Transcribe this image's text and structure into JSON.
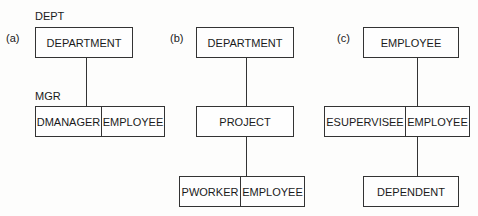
{
  "panels": [
    {
      "id": "a",
      "label": "(a)",
      "top_caption": "DEPT",
      "mid_caption": "MGR",
      "root": "DEPARTMENT",
      "child": {
        "left": "DMANAGER",
        "right": "EMPLOYEE"
      }
    },
    {
      "id": "b",
      "label": "(b)",
      "root": "DEPARTMENT",
      "middle": "PROJECT",
      "child": {
        "left": "PWORKER",
        "right": "EMPLOYEE"
      }
    },
    {
      "id": "c",
      "label": "(c)",
      "root": "EMPLOYEE",
      "middle": {
        "left": "ESUPERVISEE",
        "right": "EMPLOYEE"
      },
      "child": "DEPENDENT"
    }
  ]
}
